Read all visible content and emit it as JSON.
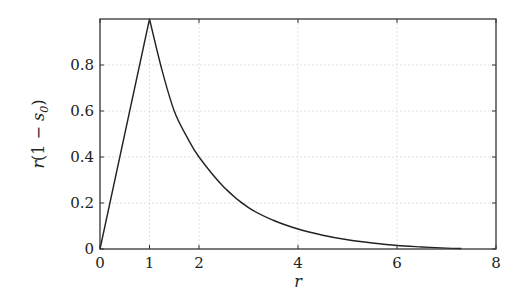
{
  "chart_data": {
    "type": "line",
    "title": "",
    "xlabel": "r",
    "ylabel": "r(1 − s₀)",
    "ylabel_parts": {
      "pre": "r",
      "mid": "(1 − ",
      "var": "s",
      "sub": "0",
      "post": ")"
    },
    "xlim": [
      0,
      8
    ],
    "ylim": [
      0,
      1
    ],
    "xticks": [
      0,
      1,
      2,
      4,
      6,
      8
    ],
    "xtick_labels": [
      "0",
      "1",
      "2",
      "4",
      "6",
      "8"
    ],
    "yticks": [
      0,
      0.2,
      0.4,
      0.6,
      0.8
    ],
    "ytick_labels": [
      "0",
      "0.2",
      "0.4",
      "0.6",
      "0.8"
    ],
    "grid": true,
    "series": [
      {
        "name": "r(1 - s0)",
        "x": [
          0,
          1,
          1.25,
          1.5,
          1.75,
          2,
          2.5,
          3,
          3.5,
          4,
          4.5,
          5,
          5.5,
          6,
          6.5,
          7,
          7.3
        ],
        "y": [
          0,
          1,
          0.78,
          0.6,
          0.49,
          0.4,
          0.27,
          0.18,
          0.125,
          0.087,
          0.06,
          0.04,
          0.026,
          0.015,
          0.009,
          0.004,
          0.002
        ]
      }
    ]
  },
  "colors": {
    "line": "#222222",
    "axis": "#333333",
    "grid": "#d8d8d8"
  }
}
